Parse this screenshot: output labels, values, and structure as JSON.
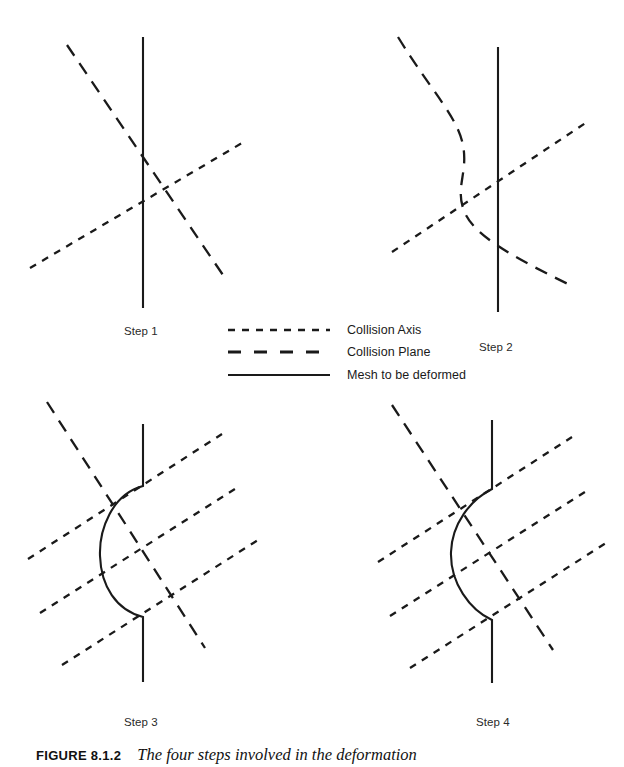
{
  "figure": {
    "caption_number": "FIGURE 8.1.2",
    "caption_text": "The four steps involved in the deformation"
  },
  "legend": {
    "items": [
      {
        "label": "Collision Axis",
        "style": "short-dashed"
      },
      {
        "label": "Collision Plane",
        "style": "long-dashed"
      },
      {
        "label": "Mesh to be deformed",
        "style": "solid"
      }
    ]
  },
  "panels": [
    {
      "id": "step-1",
      "label": "Step 1",
      "description": "Undeformed vertical mesh crossed by one collision plane and one collision axis"
    },
    {
      "id": "step-2",
      "label": "Step 2",
      "description": "Collision plane bends; mesh begins to register contact"
    },
    {
      "id": "step-3",
      "label": "Step 3",
      "description": "Mesh bulges outward into a rounded arc between two break points"
    },
    {
      "id": "step-4",
      "label": "Step 4",
      "description": "Mesh relaxes into a smooth S-shaped deformation"
    }
  ],
  "colors": {
    "ink": "#1a1a1a",
    "background": "#ffffff"
  }
}
